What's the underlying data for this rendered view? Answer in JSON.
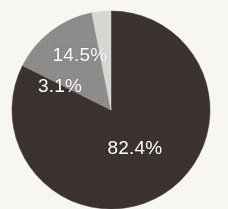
{
  "chart_data": {
    "type": "pie",
    "title": "",
    "subtitle": "",
    "xlabel": "",
    "ylabel": "",
    "grid": false,
    "legend": "none",
    "start_angle_deg": 0,
    "direction": "clockwise",
    "units": "percent",
    "categories": [
      "Segment 1",
      "Segment 2",
      "Segment 3"
    ],
    "values": [
      82.4,
      14.5,
      3.1
    ],
    "labels": [
      "82.4%",
      "14.5%",
      "3.1%"
    ],
    "colors": [
      "#3b322f",
      "#8d8c8a",
      "#d8d6d3"
    ],
    "slices": [
      {
        "label": "82.4%",
        "value": 82.4,
        "color": "#3b322f",
        "start_deg": 0,
        "end_deg": 296.64,
        "label_x": 135,
        "label_y": 148
      },
      {
        "label": "14.5%",
        "value": 14.5,
        "color": "#8d8c8a",
        "start_deg": 296.64,
        "end_deg": 348.84,
        "label_x": 80,
        "label_y": 55
      },
      {
        "label": "3.1%",
        "value": 3.1,
        "color": "#d8d6d3",
        "start_deg": 348.84,
        "end_deg": 360,
        "label_x": 60,
        "label_y": 86
      }
    ]
  },
  "figure": {
    "background": "#f7f6f3",
    "label_color": "#ffffff",
    "center_x": 111,
    "center_y": 110,
    "radius": 99
  }
}
